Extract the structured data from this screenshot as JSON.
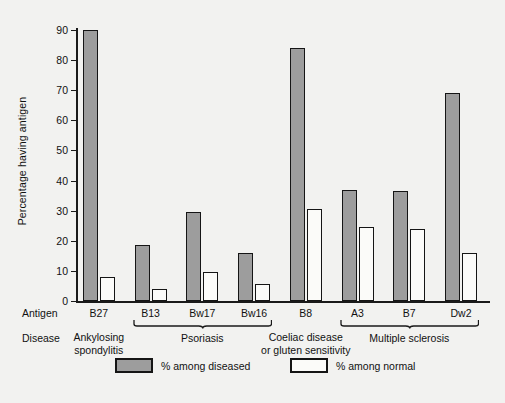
{
  "chart_data": {
    "type": "bar",
    "title": "",
    "xlabel": "Antigen",
    "ylabel": "Percentage having antigen",
    "ylim": [
      0,
      90
    ],
    "yticks": [
      0,
      10,
      20,
      30,
      40,
      50,
      60,
      70,
      80,
      90
    ],
    "grid": false,
    "legend_position": "bottom",
    "categories": [
      "B27",
      "B13",
      "Bw17",
      "Bw16",
      "B8",
      "A3",
      "B7",
      "Dw2"
    ],
    "series": [
      {
        "name": "% among diseased",
        "color": "#9d9d9d",
        "values": [
          90,
          18.5,
          29.5,
          16,
          84,
          37,
          36.5,
          69
        ]
      },
      {
        "name": "% among normal",
        "color": "#fbfbf9",
        "values": [
          8,
          4,
          9.5,
          5.5,
          30.5,
          24.5,
          24,
          16
        ]
      }
    ],
    "group_labels": [
      {
        "label": "Ankylosing spondylitis",
        "categories": [
          "B27"
        ],
        "brace": false
      },
      {
        "label": "Psoriasis",
        "categories": [
          "B13",
          "Bw17",
          "Bw16"
        ],
        "brace": true
      },
      {
        "label": "Coeliac disease or gluten sensitivity",
        "categories": [
          "B8"
        ],
        "brace": false
      },
      {
        "label": "Multiple sclerosis",
        "categories": [
          "A3",
          "B7",
          "Dw2"
        ],
        "brace": true
      }
    ]
  },
  "axes": {
    "y_title": "Percentage having antigen",
    "tick_labels": [
      "90",
      "80",
      "70",
      "60",
      "50",
      "40",
      "30",
      "20",
      "10",
      "0"
    ]
  },
  "rows": {
    "antigen_label": "Antigen",
    "disease_label": "Disease",
    "antigen_values": [
      "B27",
      "B13",
      "Bw17",
      "Bw16",
      "B8",
      "A3",
      "B7",
      "Dw2"
    ],
    "disease_groups": [
      {
        "line1": "Ankylosing",
        "line2": "spondylitis"
      },
      {
        "line1": "Psoriasis",
        "line2": ""
      },
      {
        "line1": "Coeliac disease",
        "line2": "or gluten sensitivity"
      },
      {
        "line1": "Multiple sclerosis",
        "line2": ""
      }
    ]
  },
  "legend": {
    "diseased_label": "% among diseased",
    "normal_label": "% among normal"
  }
}
